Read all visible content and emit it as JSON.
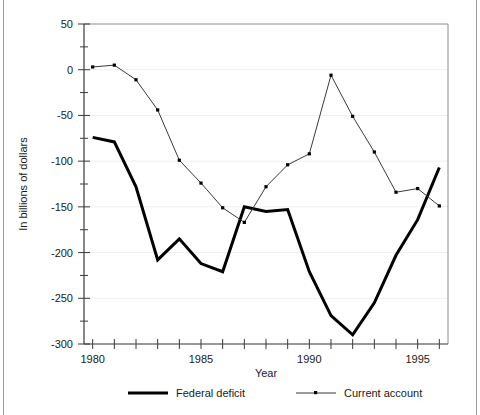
{
  "chart_data": {
    "type": "line",
    "title": "",
    "xlabel": "Year",
    "ylabel": "In billions of dollars",
    "xlim": [
      1979.6,
      1996.4
    ],
    "ylim": [
      -300,
      50
    ],
    "grid": true,
    "grid_axis": "y",
    "legend_position": "bottom",
    "x": [
      1980,
      1981,
      1982,
      1983,
      1984,
      1985,
      1986,
      1987,
      1988,
      1989,
      1990,
      1991,
      1992,
      1993,
      1994,
      1995,
      1996
    ],
    "xticks": [
      1980,
      1981,
      1982,
      1983,
      1984,
      1985,
      1986,
      1987,
      1988,
      1989,
      1990,
      1991,
      1992,
      1993,
      1994,
      1995,
      1996
    ],
    "xtick_labels": [
      "1980",
      "",
      "",
      "",
      "",
      "1985",
      "",
      "",
      "",
      "",
      "1990",
      "",
      "",
      "",
      "",
      "1995",
      ""
    ],
    "yticks": [
      50,
      25,
      0,
      -25,
      -50,
      -75,
      -100,
      -125,
      -150,
      -175,
      -200,
      -225,
      -250,
      -275,
      -300
    ],
    "ytick_labels": [
      "50",
      "",
      "0",
      "",
      "-50",
      "",
      "-100",
      "",
      "-150",
      "",
      "-200",
      "",
      "-250",
      "",
      "-300"
    ],
    "series": [
      {
        "name": "Federal deficit",
        "color": "#000000",
        "line_width": 3,
        "markers": false,
        "values": [
          -74,
          -79,
          -128,
          -208,
          -185,
          -212,
          -221,
          -150,
          -155,
          -153,
          -221,
          -269,
          -290,
          -255,
          -203,
          -164,
          -107
        ]
      },
      {
        "name": "Current account",
        "color": "#3a3a3a",
        "line_width": 1,
        "markers": true,
        "values": [
          3,
          5,
          -11,
          -44,
          -99,
          -124,
          -151,
          -167,
          -128,
          -104,
          -92,
          -6,
          -51,
          -90,
          -134,
          -130,
          -149
        ]
      }
    ]
  },
  "legend": {
    "items": [
      {
        "label": "Federal deficit",
        "style": "thick"
      },
      {
        "label": "Current account",
        "style": "thin-marker"
      }
    ]
  },
  "axes": {
    "x_title": "Year",
    "y_title": "In billions of dollars"
  }
}
